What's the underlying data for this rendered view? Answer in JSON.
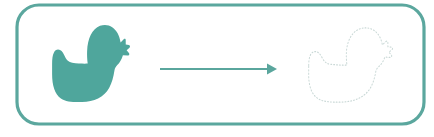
{
  "canvas": {
    "width": 434,
    "height": 137,
    "background": "#ffffff"
  },
  "colors": {
    "teal_fill": "#4FA69C",
    "teal_border": "#5BA79E",
    "arrow": "#5AA69D",
    "dotted_outline": "#C9D8D6",
    "background": "#ffffff"
  },
  "frame": {
    "name": "rounded-card-border",
    "x": 17,
    "y": 5,
    "width": 407,
    "height": 119,
    "radius": 22,
    "stroke_width": 3.2,
    "stroke_color": "#5BA79E",
    "fill": "none"
  },
  "shapes": {
    "solid_duck": {
      "label": "filled rubber duck silhouette",
      "role": "source",
      "fill": "#4FA69C",
      "facing": "right",
      "bbox": {
        "x": 44,
        "y": 23,
        "width": 93,
        "height": 82
      }
    },
    "dotted_duck": {
      "label": "dotted rubber duck outline",
      "role": "target",
      "stroke": "#C9D8D6",
      "style": "dotted",
      "dot_size": 1.05,
      "dot_gap": 2.1,
      "facing": "right",
      "bbox": {
        "x": 300,
        "y": 26,
        "width": 100,
        "height": 79
      }
    },
    "arrow": {
      "label": "transformation arrow",
      "color": "#5AA69D",
      "direction": "right",
      "x_start": 160,
      "x_end": 277,
      "y": 69,
      "shaft_width": 2.0,
      "head_width": 11,
      "head_height": 10
    }
  },
  "duck_path": "M 11.5 44.0 C 11.5 33.0 15.0 28.5 20.0 28.5 C 24.0 28.5 26.5 31.0 28.6 34.4 C 31.5 39.0 34.0 42.0 40.0 42.6 C 48.0 43.4 56.5 43.8 62.0 43.5 C 61.2 39.0 61.0 34.0 61.2 30.0 C 61.8 17.0 68.5 6.0 79.5 3.0 C 90.0 0.2 99.5 4.0 104.5 11.0 C 106.6 14.0 108.0 17.5 108.7 21.0 L 113.5 17.2 C 114.6 16.3 116.0 16.9 116.0 18.2 L 116.0 23.0 L 120.6 23.6 C 122.2 23.8 122.6 25.6 121.3 26.5 L 117.3 29.2 L 120.5 32.2 C 121.7 33.3 120.9 35.1 119.3 35.0 L 112.0 34.6 C 110.3 39.0 107.5 42.6 104.0 45.2 C 102.0 46.8 100.5 48.5 100.0 51.0 C 98.5 58.0 96.5 64.0 92.6 69.4 C 85.0 79.8 71.0 84.5 54.0 84.8 C 41.0 85.0 31.0 84.6 24.0 81.0 C 15.5 76.6 11.5 67.0 11.5 55.0 Z",
  "annotations": {
    "worksheet_type": "shape tracing",
    "instruction_implied": "match the solid shape to its dotted outline"
  }
}
